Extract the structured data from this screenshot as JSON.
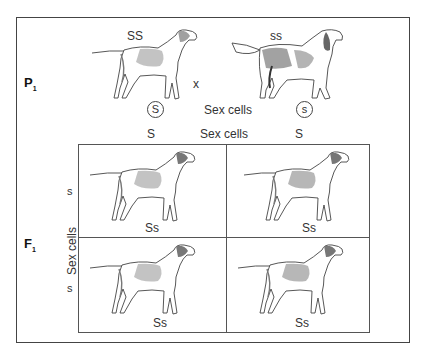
{
  "diagram": {
    "type": "punnett-square-cross",
    "parental": {
      "generation_label": "P",
      "generation_subscript": "1",
      "cross_symbol": "x",
      "parent_left": {
        "genotype": "SS",
        "breed_style": "pointer"
      },
      "parent_right": {
        "genotype": "ss",
        "breed_style": "setter"
      },
      "gamete_left": "S",
      "gamete_right": "s",
      "gametes_label": "Sex cells"
    },
    "punnett": {
      "generation_label": "F",
      "generation_subscript": "1",
      "top_label": "Sex cells",
      "side_label": "Sex cells",
      "column_alleles": [
        "S",
        "S"
      ],
      "row_alleles": [
        "s",
        "s"
      ],
      "cells": [
        {
          "genotype": "Ss"
        },
        {
          "genotype": "Ss"
        },
        {
          "genotype": "Ss"
        },
        {
          "genotype": "Ss"
        }
      ]
    }
  }
}
